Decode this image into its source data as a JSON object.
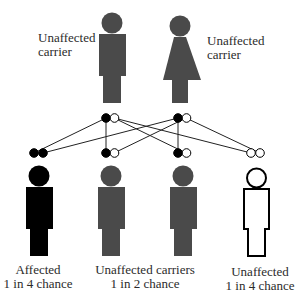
{
  "diagram": {
    "type": "autosomal-recessive-inheritance",
    "colors": {
      "carrier": "#4a4a4a",
      "affected": "#000000",
      "unaffected_outline": "#000000",
      "allele_recessive": "#000000",
      "allele_normal": "#ffffff",
      "line": "#222222"
    },
    "parents": [
      {
        "id": "father",
        "sex": "male",
        "status": "carrier",
        "label_line1": "Unaffected",
        "label_line2": "carrier",
        "alleles": [
          "recessive",
          "normal"
        ]
      },
      {
        "id": "mother",
        "sex": "female",
        "status": "carrier",
        "label_line1": "Unaffected",
        "label_line2": "carrier",
        "alleles": [
          "recessive",
          "normal"
        ]
      }
    ],
    "children": [
      {
        "id": "child-1",
        "status": "affected",
        "alleles": [
          "recessive",
          "recessive"
        ]
      },
      {
        "id": "child-2",
        "status": "carrier",
        "alleles": [
          "recessive",
          "normal"
        ]
      },
      {
        "id": "child-3",
        "status": "carrier",
        "alleles": [
          "recessive",
          "normal"
        ]
      },
      {
        "id": "child-4",
        "status": "unaffected",
        "alleles": [
          "normal",
          "normal"
        ]
      }
    ],
    "captions": [
      {
        "line1": "Affected",
        "line2": "1 in 4 chance"
      },
      {
        "line1": "Unaffected carriers",
        "line2": "1 in 2 chance"
      },
      {
        "line1": "Unaffected",
        "line2": "1 in 4 chance"
      }
    ]
  }
}
